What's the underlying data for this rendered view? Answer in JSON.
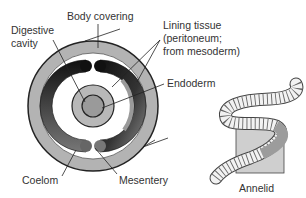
{
  "figure": {
    "labels": {
      "body_covering": "Body covering",
      "digestive_cavity_line1": "Digestive",
      "digestive_cavity_line2": "cavity",
      "lining_tissue_line1": "Lining tissue",
      "lining_tissue_line2": "(peritoneum;",
      "lining_tissue_line3": "from mesoderm)",
      "endoderm": "Endoderm",
      "coelom": "Coelom",
      "mesentery": "Mesentery",
      "annelid": "Annelid"
    },
    "colors": {
      "outer_ring": "#b3b3b3",
      "coelom_dark": "#1a1a1a",
      "coelom_mid": "#6e6e6e",
      "gut_ring": "#b8b8b8",
      "gut_center": "#9a9a9a",
      "outline": "#222222",
      "square_fill": "#cfcfcf",
      "worm_highlight": "#9c9c9c"
    }
  }
}
